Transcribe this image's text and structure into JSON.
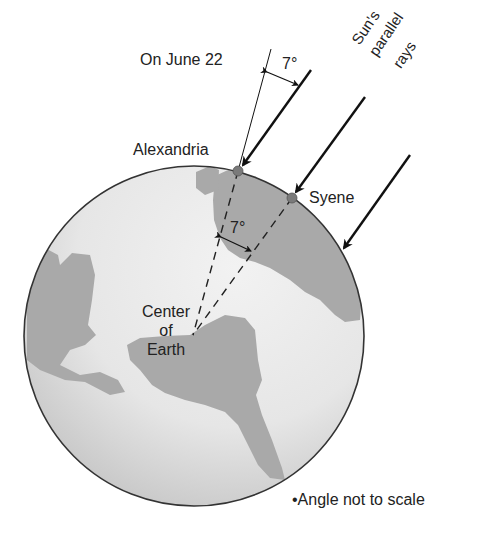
{
  "diagram": {
    "title_label": "On June 22",
    "rays_label": [
      "Sun's",
      "parallel",
      "rays"
    ],
    "city_north": "Alexandria",
    "city_south": "Syene",
    "center_label": [
      "Center",
      "of",
      "Earth"
    ],
    "angle_top": "7°",
    "angle_center": "7°",
    "footnote": "•Angle not to scale",
    "colors": {
      "ocean": "#ebebeb",
      "land": "#a9a9a9",
      "outline": "#333333",
      "city_dot": "#7a7a7a"
    }
  }
}
